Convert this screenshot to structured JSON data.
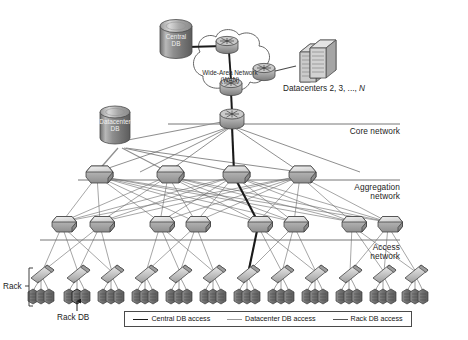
{
  "databases": {
    "central": {
      "line1": "Central",
      "line2": "DB"
    },
    "datacenter": {
      "line1": "Datacenter",
      "line2": "DB"
    }
  },
  "wan": {
    "line1": "Wide-Area Network",
    "line2": "(WAN)"
  },
  "datacenters": {
    "label_prefix": "Datacenters 2, 3, ..., ",
    "label_italic": "N"
  },
  "tiers": [
    {
      "name": "core",
      "line1": "Core network",
      "line2": ""
    },
    {
      "name": "aggregation",
      "line1": "Aggregation",
      "line2": "network"
    },
    {
      "name": "access",
      "line1": "Access",
      "line2": "network"
    }
  ],
  "annotations": {
    "rack": "Rack",
    "rack_db": "Rack DB"
  },
  "legend": {
    "items": [
      {
        "label": "Central DB access",
        "style": "sw-central",
        "color": "#1a1a1a"
      },
      {
        "label": "Datacenter DB access",
        "style": "sw-datacenter",
        "color": "#9a9a9a"
      },
      {
        "label": "Rack DB access",
        "style": "sw-rack",
        "color": "#555555"
      }
    ]
  },
  "topology": {
    "core_switches": 1,
    "aggregation_switches": 4,
    "access_switches": 8,
    "racks": 12,
    "servers_per_rack": 3,
    "wan_routers": 3
  },
  "colors": {
    "tier_line": "#666666",
    "central_path": "#1a1a1a",
    "datacenter_path": "#9a9a9a",
    "rack_path": "#555555",
    "device_light": "#e8e8e8",
    "device_mid": "#b4b4b4",
    "device_dark": "#6e6e6e",
    "server_dark": "#7a7a7a"
  }
}
